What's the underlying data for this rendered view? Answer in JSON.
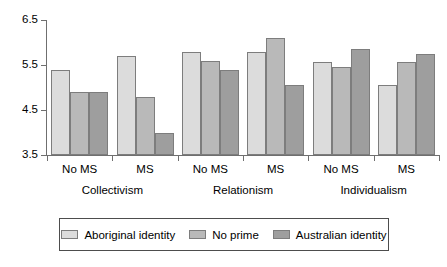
{
  "chart_data": {
    "type": "bar",
    "title": "",
    "subtitle": "",
    "xlabel": "",
    "ylabel": "",
    "ylim": [
      3.5,
      6.5
    ],
    "yticks": [
      "3.5",
      "4.5",
      "5.5",
      "6.5"
    ],
    "ytick_values": [
      3.5,
      4.5,
      5.5,
      6.5
    ],
    "grid": false,
    "legend_position": "bottom",
    "categories": [
      "No MS",
      "MS",
      "No MS",
      "MS",
      "No MS",
      "MS"
    ],
    "group_labels": [
      "Collectivism",
      "Relationism",
      "Individualism"
    ],
    "series": [
      {
        "name": "Aboriginal identity",
        "color": "#dcdcdc",
        "values": [
          5.4,
          5.7,
          5.8,
          5.8,
          5.57,
          5.05
        ]
      },
      {
        "name": "No prime",
        "color": "#b9b9b9",
        "values": [
          4.9,
          4.8,
          5.6,
          6.1,
          5.45,
          5.57
        ]
      },
      {
        "name": "Australian identity",
        "color": "#9e9e9e",
        "values": [
          4.9,
          4.0,
          5.4,
          5.05,
          5.85,
          5.75
        ]
      }
    ]
  },
  "axis": {
    "y_ticks": [
      {
        "label": "6.5",
        "value": 6.5
      },
      {
        "label": "5.5",
        "value": 5.5
      },
      {
        "label": "4.5",
        "value": 4.5
      },
      {
        "label": "3.5",
        "value": 3.5
      }
    ]
  },
  "x_axis": {
    "ticks": [
      {
        "label": "No MS"
      },
      {
        "label": "MS"
      },
      {
        "label": "No MS"
      },
      {
        "label": "MS"
      },
      {
        "label": "No MS"
      },
      {
        "label": "MS"
      }
    ],
    "groups": [
      {
        "label": "Collectivism"
      },
      {
        "label": "Relationism"
      },
      {
        "label": "Individualism"
      }
    ]
  },
  "legend": {
    "items": [
      {
        "label": "Aboriginal identity",
        "color": "#dcdcdc"
      },
      {
        "label": "No prime",
        "color": "#b9b9b9"
      },
      {
        "label": "Australian identity",
        "color": "#9e9e9e"
      }
    ]
  }
}
